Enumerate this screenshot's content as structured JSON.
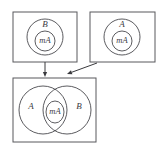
{
  "figure": {
    "background_color": "#ffffff",
    "stroke_color": "#4a4a4e",
    "frame_color": "#58585c",
    "width": 161,
    "height": 148
  },
  "panels": [
    {
      "id": "panel-top-left",
      "outer_label": "B",
      "inner_label": "mA",
      "frame": {
        "x": 13,
        "y": 12,
        "w": 64,
        "h": 50
      },
      "outer_circle": {
        "cx": 45,
        "cy": 37,
        "r": 18
      },
      "inner_circle": {
        "cx": 45,
        "cy": 41,
        "r": 10
      },
      "outer_label_pos": {
        "x": 45,
        "y": 25
      },
      "inner_label_pos": {
        "x": 45,
        "y": 41
      }
    },
    {
      "id": "panel-top-right",
      "outer_label": "A",
      "inner_label": "mA",
      "frame": {
        "x": 90,
        "y": 12,
        "w": 65,
        "h": 50
      },
      "outer_circle": {
        "cx": 122,
        "cy": 37,
        "r": 18
      },
      "inner_circle": {
        "cx": 122,
        "cy": 41,
        "r": 10
      },
      "outer_label_pos": {
        "x": 122,
        "y": 25
      },
      "inner_label_pos": {
        "x": 122,
        "y": 41
      }
    }
  ],
  "venn_panel": {
    "id": "panel-bottom",
    "frame": {
      "x": 13,
      "y": 78,
      "w": 83,
      "h": 64
    },
    "left_label": "A",
    "right_label": "B",
    "center_label": "mA",
    "left_circle": {
      "cx": 43,
      "cy": 110,
      "r": 24
    },
    "right_circle": {
      "cx": 67,
      "cy": 110,
      "r": 24
    },
    "center_lens": {
      "cx": 55,
      "cy": 112,
      "rx": 9,
      "ry": 11
    },
    "left_label_pos": {
      "x": 31,
      "y": 107
    },
    "right_label_pos": {
      "x": 79,
      "y": 107
    },
    "center_label_pos": {
      "x": 55,
      "y": 112
    }
  },
  "arrows": [
    {
      "id": "arrow-down",
      "from_panel": "panel-top-left",
      "to_panel": "panel-bottom",
      "start": {
        "x": 45,
        "y": 62
      },
      "end": {
        "x": 45,
        "y": 77
      },
      "kind": "vertical"
    },
    {
      "id": "arrow-diagonal",
      "from_panel": "panel-top-right",
      "to_panel": "panel-bottom",
      "start": {
        "x": 97,
        "y": 63
      },
      "end": {
        "x": 67,
        "y": 74
      },
      "kind": "diagonal"
    }
  ]
}
